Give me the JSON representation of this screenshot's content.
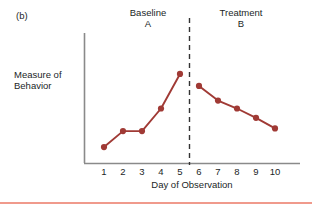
{
  "figure": {
    "panel_label": "(b)",
    "accent_color": "#a03a35",
    "axis_color": "#8a8a8a",
    "divider_color": "#333333",
    "rule_color": "#f09a8c"
  },
  "phases": [
    {
      "name": "Baseline",
      "letter": "A",
      "header": "Baseline\nA"
    },
    {
      "name": "Treatment",
      "letter": "B",
      "header": "Treatment\nB"
    }
  ],
  "phase_a_header": "Baseline A",
  "phase_b_header": "Treatment B",
  "chart_data": {
    "type": "line",
    "title": "",
    "xlabel": "Day of Observation",
    "ylabel": "Measure of Behavior",
    "x": [
      1,
      2,
      3,
      4,
      5,
      6,
      7,
      8,
      9,
      10
    ],
    "categories": [
      "1",
      "2",
      "3",
      "4",
      "5",
      "6",
      "7",
      "8",
      "9",
      "10"
    ],
    "series": [
      {
        "name": "Measure of Behavior",
        "color": "#a03a35",
        "values": [
          1.2,
          2.4,
          2.4,
          4.1,
          6.7,
          5.8,
          4.7,
          4.1,
          3.4,
          2.6
        ]
      }
    ],
    "xlim": [
      0.4,
      10.6
    ],
    "ylim": [
      0,
      7.6
    ],
    "grid": false,
    "legend": false,
    "markers": true,
    "marker_shape": "circle",
    "y_ticks_visible": false,
    "annotations": [
      {
        "type": "phase-divider",
        "style": "dashed",
        "x": 5.5,
        "label": "phase change line"
      },
      {
        "type": "text",
        "text": "Baseline",
        "x": 3,
        "position": "top"
      },
      {
        "type": "text",
        "text": "A",
        "x": 3,
        "position": "top"
      },
      {
        "type": "text",
        "text": "Treatment",
        "x": 8,
        "position": "top"
      },
      {
        "type": "text",
        "text": "B",
        "x": 8,
        "position": "top"
      }
    ]
  }
}
